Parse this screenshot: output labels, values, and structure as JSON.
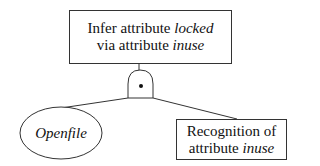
{
  "diagram": {
    "type": "attack-tree",
    "root": {
      "line1_plain": "Infer attribute ",
      "line1_italic": "locked",
      "line2_plain": "via attribute ",
      "line2_italic": "inuse"
    },
    "gate": {
      "type": "AND",
      "symbol": "•"
    },
    "children": [
      {
        "shape": "ellipse",
        "italic_label": "Openfile"
      },
      {
        "shape": "rectangle",
        "line1_plain": "Recognition of",
        "line2_plain": "attribute ",
        "line2_italic": "inuse"
      }
    ]
  }
}
